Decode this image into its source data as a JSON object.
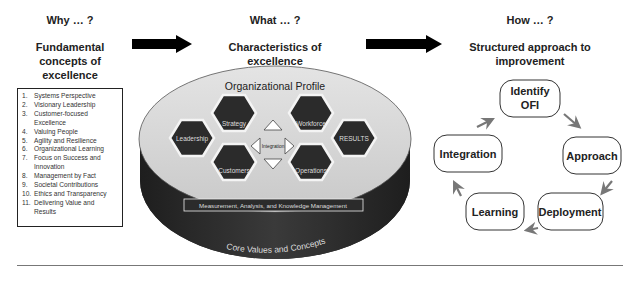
{
  "why": {
    "heading": "Why … ?",
    "subtitle_lines": [
      "Fundamental",
      "concepts of",
      "excellence"
    ],
    "concepts": [
      {
        "num": "1.",
        "text": "Systems Perspective"
      },
      {
        "num": "2.",
        "text": "Visionary Leadership"
      },
      {
        "num": "3.",
        "text": "Customer-focused Excellence"
      },
      {
        "num": "4.",
        "text": "Valuing People"
      },
      {
        "num": "5.",
        "text": "Agility and Resilience"
      },
      {
        "num": "6.",
        "text": "Organizational Learning"
      },
      {
        "num": "7.",
        "text": "Focus on Success and Innovation"
      },
      {
        "num": "8.",
        "text": "Management by Fact"
      },
      {
        "num": "9.",
        "text": "Societal Contributions"
      },
      {
        "num": "10.",
        "text": "Ethics and Transparency"
      },
      {
        "num": "11.",
        "text": "Delivering Value and Results"
      }
    ]
  },
  "what": {
    "heading": "What … ?",
    "subtitle_lines": [
      "Characteristics of",
      "excellence"
    ],
    "framework": {
      "top_label": "Organizational Profile",
      "hexagons": {
        "leadership": "Leadership",
        "strategy": "Strategy",
        "customers": "Customers",
        "workforce": "Workforce",
        "operations": "Operations",
        "results": "RESULTS"
      },
      "center_label": "Integration",
      "foundation_bar": "Measurement, Analysis, and Knowledge Management",
      "base_label": "Core Values and Concepts"
    }
  },
  "how": {
    "heading": "How … ?",
    "subtitle_lines": [
      "Structured approach to",
      "improvement"
    ],
    "cycle": {
      "identify_lines": [
        "Identify",
        "OFI"
      ],
      "approach": "Approach",
      "deployment": "Deployment",
      "learning": "Learning",
      "integration": "Integration"
    }
  },
  "colors": {
    "hexagon_fill": "#2b2b2b",
    "ellipse_top": "#d6d6d6",
    "ellipse_side": "#2e2e2e",
    "arrow_fill": "#000000",
    "cycle_arrow": "#777777"
  }
}
